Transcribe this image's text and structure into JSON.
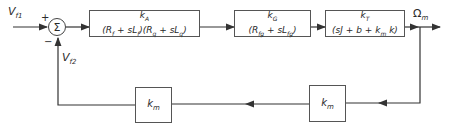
{
  "signals": {
    "input1": "V",
    "input1_sub": "f1",
    "input2": "V",
    "input2_sub": "f2",
    "output": "Ω",
    "output_sub": "m"
  },
  "summing_junction": {
    "symbol": "Σ",
    "plus_sign": "+",
    "minus_sign": "−"
  },
  "forward_blocks": [
    {
      "numerator": "k_A",
      "denominator": "(R_f + sL_f)(R_q + sL_q)"
    },
    {
      "numerator": "k_G",
      "denominator": "(R_fg + sL_fg)"
    },
    {
      "numerator": "k_T",
      "denominator": "(sJ + b + k_m k)"
    }
  ],
  "feedback_blocks": [
    {
      "gain": "k_m"
    },
    {
      "gain": "k_m"
    }
  ],
  "colors": {
    "line": "#333333",
    "background": "#ffffff"
  }
}
